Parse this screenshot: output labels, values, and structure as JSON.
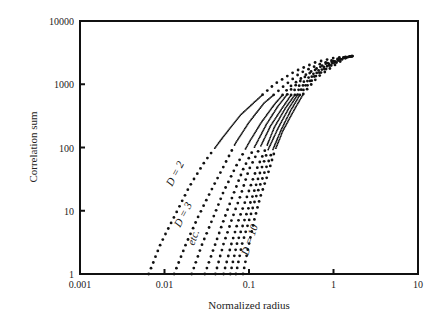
{
  "chart_data": {
    "type": "scatter",
    "title": "",
    "xlabel": "Normalized radius",
    "ylabel": "Correlation sum",
    "xscale": "log",
    "yscale": "log",
    "xlim": [
      0.001,
      10
    ],
    "ylim": [
      1,
      10000
    ],
    "xticks": [
      "0.001",
      "0.01",
      "0.1",
      "1",
      "10"
    ],
    "yticks": [
      "1",
      "10",
      "100",
      "1000",
      "10000"
    ],
    "grid": false,
    "legend": null,
    "annotations": [
      "D = 2",
      "D = 3",
      "etc.",
      "D = 10"
    ],
    "series": [
      {
        "name": "D = 2",
        "x": [
          0.0065,
          0.009,
          0.013,
          0.02,
          0.03,
          0.05,
          0.08,
          0.13,
          0.2,
          0.35,
          0.6,
          1.0,
          1.7
        ],
        "y": [
          1,
          3,
          8,
          25,
          60,
          150,
          330,
          600,
          1000,
          1600,
          2200,
          2600,
          2800
        ]
      },
      {
        "name": "D = 3",
        "x": [
          0.013,
          0.018,
          0.025,
          0.035,
          0.05,
          0.07,
          0.1,
          0.15,
          0.25,
          0.4,
          0.7,
          1.2,
          1.7
        ],
        "y": [
          1,
          3,
          8,
          20,
          50,
          120,
          250,
          500,
          900,
          1500,
          2100,
          2600,
          2800
        ]
      },
      {
        "name": "D = 4",
        "x": [
          0.021,
          0.028,
          0.038,
          0.05,
          0.07,
          0.1,
          0.14,
          0.2,
          0.3,
          0.5,
          0.8,
          1.3,
          1.7
        ],
        "y": [
          1,
          3,
          8,
          20,
          50,
          120,
          250,
          480,
          900,
          1500,
          2100,
          2600,
          2800
        ]
      },
      {
        "name": "D = 5",
        "x": [
          0.03,
          0.04,
          0.05,
          0.065,
          0.085,
          0.12,
          0.16,
          0.22,
          0.32,
          0.5,
          0.8,
          1.3,
          1.7
        ],
        "y": [
          1,
          3,
          7,
          18,
          45,
          110,
          230,
          450,
          850,
          1450,
          2100,
          2600,
          2800
        ]
      },
      {
        "name": "D = 6",
        "x": [
          0.04,
          0.05,
          0.062,
          0.08,
          0.1,
          0.14,
          0.18,
          0.25,
          0.35,
          0.55,
          0.85,
          1.3,
          1.7
        ],
        "y": [
          1,
          3,
          7,
          18,
          45,
          110,
          220,
          430,
          830,
          1400,
          2050,
          2600,
          2800
        ]
      },
      {
        "name": "D = 7",
        "x": [
          0.05,
          0.062,
          0.075,
          0.095,
          0.12,
          0.16,
          0.2,
          0.27,
          0.38,
          0.58,
          0.9,
          1.3,
          1.7
        ],
        "y": [
          1,
          3,
          7,
          17,
          42,
          100,
          210,
          420,
          800,
          1400,
          2050,
          2600,
          2800
        ]
      },
      {
        "name": "D = 8",
        "x": [
          0.06,
          0.072,
          0.088,
          0.11,
          0.135,
          0.17,
          0.22,
          0.29,
          0.4,
          0.6,
          0.9,
          1.3,
          1.7
        ],
        "y": [
          1,
          3,
          7,
          17,
          40,
          95,
          200,
          400,
          780,
          1350,
          2000,
          2600,
          2800
        ]
      },
      {
        "name": "D = 9",
        "x": [
          0.07,
          0.083,
          0.1,
          0.12,
          0.15,
          0.19,
          0.24,
          0.31,
          0.42,
          0.62,
          0.95,
          1.35,
          1.7
        ],
        "y": [
          1,
          3,
          7,
          16,
          38,
          90,
          190,
          380,
          760,
          1350,
          2000,
          2600,
          2800
        ]
      },
      {
        "name": "D = 10",
        "x": [
          0.085,
          0.1,
          0.115,
          0.135,
          0.165,
          0.2,
          0.25,
          0.33,
          0.45,
          0.65,
          1.0,
          1.4,
          1.7
        ],
        "y": [
          1,
          3,
          7,
          16,
          36,
          85,
          180,
          360,
          740,
          1300,
          1950,
          2600,
          2800
        ]
      }
    ]
  }
}
